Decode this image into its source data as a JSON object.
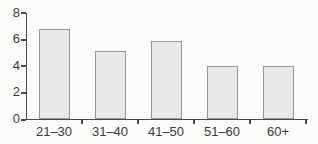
{
  "chart_data": {
    "type": "bar",
    "categories": [
      "21–30",
      "31–40",
      "41–50",
      "51–60",
      "60+"
    ],
    "values": [
      6.8,
      5.1,
      5.9,
      4,
      4
    ],
    "title": "",
    "xlabel": "",
    "ylabel": "",
    "ylim": [
      0,
      8
    ],
    "yticks": [
      0,
      2,
      4,
      6,
      8
    ],
    "grid": false,
    "legend_position": "none",
    "colors": {
      "bar_fill": "#e9e9e9",
      "bar_border": "#979797",
      "axis": "#4a4a4a",
      "text": "#3a3a3a",
      "background": "#fcfcfb"
    }
  }
}
